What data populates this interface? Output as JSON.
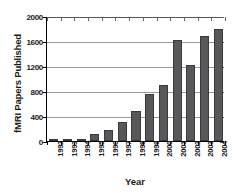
{
  "chart_data": {
    "type": "bar",
    "title": "",
    "xlabel": "Year",
    "ylabel": "fMRI Papers Published",
    "categories": [
      "1992",
      "1993",
      "1994",
      "1995",
      "1996",
      "1997",
      "1998",
      "1999",
      "2000",
      "2001",
      "2002",
      "2003",
      "2004"
    ],
    "values": [
      5,
      10,
      30,
      120,
      175,
      310,
      475,
      745,
      900,
      1610,
      1215,
      1680,
      1790
    ],
    "series": [
      {
        "name": "fMRI Papers Published",
        "values": [
          5,
          10,
          30,
          120,
          175,
          310,
          475,
          745,
          900,
          1610,
          1215,
          1680,
          1790
        ]
      }
    ],
    "ylim": [
      0,
      2000
    ],
    "yticks": [
      0,
      400,
      800,
      1200,
      1600,
      2000
    ],
    "ytick_labels": [
      "0",
      "400",
      "800",
      "1200",
      "1600",
      "2000"
    ],
    "grid": "horizontal",
    "legend": "none",
    "bar_color": "#585759",
    "gridline_color": "#9a9a9a",
    "axis_color": "#000000"
  }
}
